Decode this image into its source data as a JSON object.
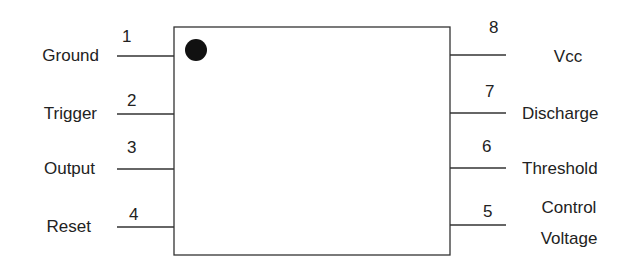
{
  "left_pins": [
    {
      "number": "1",
      "label": "Ground"
    },
    {
      "number": "2",
      "label": "Trigger"
    },
    {
      "number": "3",
      "label": "Output"
    },
    {
      "number": "4",
      "label": "Reset"
    }
  ],
  "right_pins": [
    {
      "number": "8",
      "label": "Vcc",
      "label2": ""
    },
    {
      "number": "7",
      "label": "Discharge",
      "label2": ""
    },
    {
      "number": "6",
      "label": "Threshold",
      "label2": ""
    },
    {
      "number": "5",
      "label": "Control",
      "label2": "Voltage"
    }
  ],
  "pin1_marker": "filled-dot"
}
